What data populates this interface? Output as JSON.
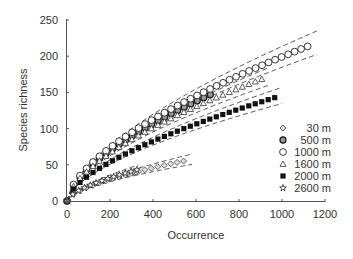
{
  "chart_data": {
    "type": "scatter",
    "title": "",
    "xlabel": "Occurrence",
    "ylabel": "Species richness",
    "xlim": [
      0,
      1200
    ],
    "ylim": [
      0,
      250
    ],
    "xticks": [
      0,
      200,
      400,
      600,
      800,
      1000,
      1200
    ],
    "yticks": [
      0,
      50,
      100,
      150,
      200,
      250
    ],
    "grid": false,
    "legend_position": "right-middle",
    "series": [
      {
        "name": "30 m",
        "marker": "diamond",
        "n_max": 570,
        "s_max": 57,
        "band": 7
      },
      {
        "name": "500 m",
        "marker": "circle-bold",
        "n_max": 690,
        "s_max": 150,
        "band": 10
      },
      {
        "name": "1000 m",
        "marker": "circle-open",
        "n_max": 1140,
        "s_max": 216,
        "band": 16
      },
      {
        "name": "1600 m",
        "marker": "triangle-open",
        "n_max": 920,
        "s_max": 170,
        "band": 12
      },
      {
        "name": "2000 m",
        "marker": "square-filled",
        "n_max": 980,
        "s_max": 144,
        "band": 11
      },
      {
        "name": "2600 m",
        "marker": "star-open",
        "n_max": 325,
        "s_max": 43,
        "band": 6
      }
    ],
    "curve_exponent": 0.62,
    "confidence_bands": "dashed"
  },
  "legend": {
    "items": [
      {
        "label": "30 m"
      },
      {
        "label": "500 m"
      },
      {
        "label": "1000 m"
      },
      {
        "label": "1600 m"
      },
      {
        "label": "2000 m"
      },
      {
        "label": "2600 m"
      }
    ]
  }
}
